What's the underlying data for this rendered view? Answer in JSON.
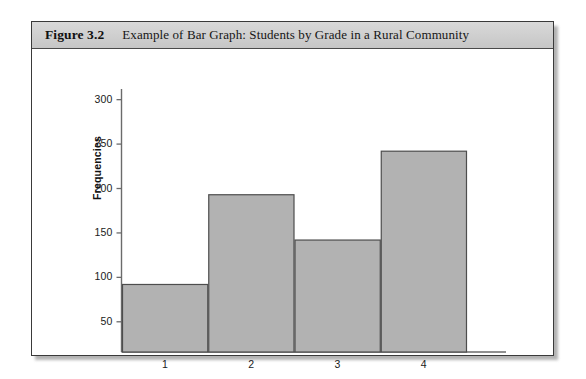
{
  "figure": {
    "label": "Figure 3.2",
    "caption": "Example of Bar Graph: Students by Grade in a Rural Community"
  },
  "chart_data": {
    "type": "bar",
    "title": "Example of Bar Graph: Students by Grade in a Rural Community",
    "categories": [
      "1",
      "2",
      "3",
      "4"
    ],
    "values": [
      92,
      193,
      142,
      242
    ],
    "xlabel": "",
    "ylabel": "Frequencies",
    "ylim": [
      16,
      312
    ],
    "yticks": [
      50,
      100,
      150,
      200,
      250,
      300
    ],
    "ytick_labels": [
      "50",
      "100",
      "150",
      "200",
      "250",
      "300"
    ],
    "grid": false,
    "legend": null,
    "bar_fill": "#b2b2b2",
    "bar_edge": "#4d4d4d",
    "axis_color": "#6b6b6b"
  }
}
